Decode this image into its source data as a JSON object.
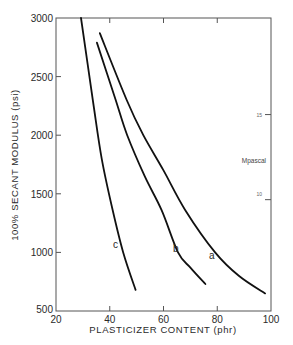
{
  "chart_data": {
    "type": "line",
    "title": "",
    "xlabel": "PLASTICIZER CONTENT (phr)",
    "ylabel": "100% SECANT MODULUS (psi)",
    "secondary_ylabel": "Mpascal",
    "xlim": [
      20,
      100
    ],
    "ylim": [
      500,
      3000
    ],
    "x_ticks": [
      20,
      40,
      60,
      80,
      100
    ],
    "y_ticks": [
      500,
      1000,
      1500,
      2000,
      2500,
      3000
    ],
    "secondary_y_ticks": [
      {
        "label": "15",
        "psi": 2176
      },
      {
        "label": "10",
        "psi": 1450
      }
    ],
    "grid": false,
    "legend": "inline curve labels",
    "series": [
      {
        "name": "a",
        "points": [
          [
            36.3,
            2870
          ],
          [
            46.3,
            2300
          ],
          [
            52.5,
            2000
          ],
          [
            60,
            1700
          ],
          [
            68.1,
            1360
          ],
          [
            79.2,
            1000
          ],
          [
            88,
            800
          ],
          [
            97.8,
            650
          ]
        ]
      },
      {
        "name": "b",
        "points": [
          [
            35.2,
            2790
          ],
          [
            42.2,
            2300
          ],
          [
            46.5,
            2000
          ],
          [
            53,
            1650
          ],
          [
            59.3,
            1360
          ],
          [
            65.4,
            1000
          ],
          [
            70,
            870
          ],
          [
            75.6,
            730
          ]
        ]
      },
      {
        "name": "c",
        "points": [
          [
            29.3,
            3000
          ],
          [
            33.7,
            2300
          ],
          [
            37,
            1800
          ],
          [
            41.1,
            1360
          ],
          [
            45,
            1000
          ],
          [
            49.6,
            680
          ]
        ]
      }
    ]
  },
  "labels": {
    "x_title": "PLASTICIZER CONTENT (phr)",
    "y_title": "100% SECANT MODULUS (psi)",
    "secondary_unit": "Mpascal",
    "secondary_tick_15": "15",
    "secondary_tick_10": "10",
    "curve_a": "a",
    "curve_b": "b",
    "curve_c": "c"
  }
}
